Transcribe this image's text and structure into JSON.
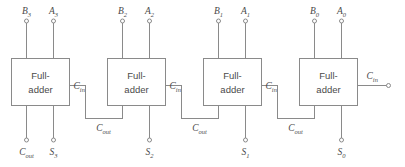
{
  "diagram": {
    "type": "logic-block-diagram",
    "width": 405,
    "height": 167,
    "colors": {
      "background": "#ffffff",
      "wire": "#8a8a8a",
      "text": "#4a4a4a",
      "box_fill": "#ffffff"
    },
    "block_label_line1": "Full-",
    "block_label_line2": "adder",
    "blocks": [
      {
        "id": "fa3",
        "input_b": "B",
        "input_b_sub": "3",
        "input_a": "A",
        "input_a_sub": "3",
        "sum": "S",
        "sum_sub": "3",
        "carry_in": "C",
        "carry_in_sub": "in",
        "carry_out": "C",
        "carry_out_sub": "out"
      },
      {
        "id": "fa2",
        "input_b": "B",
        "input_b_sub": "2",
        "input_a": "A",
        "input_a_sub": "2",
        "sum": "S",
        "sum_sub": "2",
        "carry_in": "C",
        "carry_in_sub": "in",
        "carry_out": "C",
        "carry_out_sub": "out"
      },
      {
        "id": "fa1",
        "input_b": "B",
        "input_b_sub": "1",
        "input_a": "A",
        "input_a_sub": "1",
        "sum": "S",
        "sum_sub": "1",
        "carry_in": "C",
        "carry_in_sub": "in",
        "carry_out": "C",
        "carry_out_sub": "out"
      },
      {
        "id": "fa0",
        "input_b": "B",
        "input_b_sub": "0",
        "input_a": "A",
        "input_a_sub": "0",
        "sum": "S",
        "sum_sub": "0",
        "carry_in": "C",
        "carry_in_sub": "in",
        "carry_out": "C",
        "carry_out_sub": "out"
      }
    ],
    "final_carry_out": {
      "label": "C",
      "sub": "out"
    },
    "external_carry_in": {
      "label": "C",
      "sub": "in"
    }
  }
}
